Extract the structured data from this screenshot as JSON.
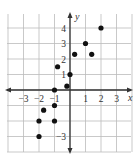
{
  "chart_data": {
    "type": "scatter",
    "title": "",
    "xlabel": "x",
    "ylabel": "y",
    "xlim": [
      -4,
      4
    ],
    "ylim": [
      -4,
      5
    ],
    "grid": true,
    "x_tick_labels": [
      "−3",
      "−2",
      "−1",
      "1",
      "2",
      "3"
    ],
    "x_tick_values": [
      -3,
      -2,
      -1,
      1,
      2,
      3
    ],
    "y_tick_labels": [
      "4",
      "3",
      "2",
      "1",
      "−3"
    ],
    "y_tick_values": [
      4,
      3,
      2,
      1,
      -3
    ],
    "points": [
      {
        "x": -2,
        "y": -3
      },
      {
        "x": -2,
        "y": -2
      },
      {
        "x": -1,
        "y": -2
      },
      {
        "x": -1.7,
        "y": -1.3
      },
      {
        "x": -1,
        "y": -1
      },
      {
        "x": -1,
        "y": 0
      },
      {
        "x": -0.2,
        "y": 0.25
      },
      {
        "x": 0,
        "y": 1
      },
      {
        "x": -0.8,
        "y": 1.5
      },
      {
        "x": 0.3,
        "y": 2.3
      },
      {
        "x": 1,
        "y": 3
      },
      {
        "x": 1.4,
        "y": 2.3
      },
      {
        "x": 2,
        "y": 4
      }
    ],
    "colors": {
      "grid": "#bbbbbb",
      "axis": "#333333",
      "point": "#111111"
    }
  }
}
